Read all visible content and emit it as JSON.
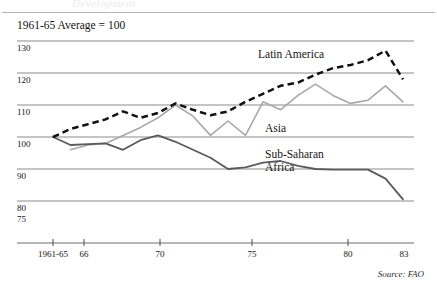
{
  "figure": {
    "ghost_title_fragment": "Development",
    "caption": "1961-65 Average = 100",
    "source": "Source: FAO"
  },
  "series_labels": {
    "latin_america": "Latin America",
    "asia": "Asia",
    "sub_saharan_africa_line1": "Sub-Saharan",
    "sub_saharan_africa_line2": "Africa"
  },
  "axis": {
    "y_ticks": [
      "130",
      "120",
      "110",
      "100",
      "90",
      "80"
    ],
    "y_extra_label": "75",
    "x_ticks": [
      "1961-65",
      "66",
      "70",
      "75",
      "80",
      "83"
    ]
  },
  "colors": {
    "latin_america": "#111111",
    "asia": "#a8a8a8",
    "sub_saharan_africa": "#5a5a5a",
    "gridline": "#8c8c8c",
    "axis": "#6e6e6e",
    "text": "#141414"
  },
  "chart_data": {
    "type": "line",
    "title": "",
    "subtitle": "1961-65 Average = 100",
    "xlabel": "",
    "ylabel": "Index (1961-65 Average = 100)",
    "xlim": [
      1963,
      1983
    ],
    "ylim": [
      75,
      132
    ],
    "yticks": [
      80,
      90,
      100,
      110,
      120,
      130
    ],
    "xticks": [
      1963,
      1966,
      1970,
      1975,
      1980,
      1983
    ],
    "xticklabels": [
      "1961-65",
      "66",
      "70",
      "75",
      "80",
      "83"
    ],
    "grid": "horizontal",
    "legend": "inline-annotations",
    "annotations": [
      {
        "text": "Latin America",
        "x": 1977.0,
        "y": 126.5
      },
      {
        "text": "Asia",
        "x": 1976.3,
        "y": 104.0
      },
      {
        "text": "Sub-Saharan Africa",
        "x": 1976.3,
        "y": 97.0
      }
    ],
    "series": [
      {
        "name": "Latin America",
        "style": "dashed",
        "color": "#111111",
        "x": [
          1963,
          1964,
          1965,
          1966,
          1967,
          1968,
          1969,
          1970,
          1971,
          1972,
          1973,
          1974,
          1975,
          1976,
          1977,
          1978,
          1979,
          1980,
          1981,
          1982,
          1983
        ],
        "y": [
          100.0,
          102.5,
          104.0,
          105.5,
          108.0,
          106.0,
          107.5,
          110.5,
          108.5,
          106.8,
          108.0,
          111.0,
          113.5,
          116.0,
          117.0,
          119.5,
          121.5,
          122.5,
          124.0,
          127.0,
          118.0
        ]
      },
      {
        "name": "Asia",
        "style": "solid",
        "color": "#a8a8a8",
        "x": [
          1964,
          1965,
          1966,
          1967,
          1968,
          1969,
          1970,
          1971,
          1972,
          1973,
          1974,
          1975,
          1976,
          1977,
          1978,
          1979,
          1980,
          1981,
          1982,
          1983
        ],
        "y": [
          96.0,
          97.5,
          98.0,
          100.5,
          103.0,
          106.0,
          110.0,
          106.5,
          100.5,
          105.0,
          100.5,
          111.0,
          108.5,
          113.0,
          116.5,
          113.0,
          110.5,
          111.5,
          116.0,
          111.0
        ]
      },
      {
        "name": "Sub-Saharan Africa",
        "style": "solid",
        "color": "#5a5a5a",
        "x": [
          1963,
          1964,
          1965,
          1966,
          1967,
          1968,
          1969,
          1970,
          1971,
          1972,
          1973,
          1974,
          1975,
          1976,
          1977,
          1978,
          1979,
          1980,
          1981,
          1982,
          1983
        ],
        "y": [
          100.0,
          97.5,
          97.8,
          98.0,
          96.0,
          99.0,
          100.5,
          98.5,
          96.0,
          93.5,
          90.0,
          90.5,
          92.0,
          92.5,
          91.0,
          90.0,
          89.8,
          89.8,
          89.8,
          87.0,
          80.5
        ]
      }
    ],
    "series_last_values": {
      "Latin America": 118.0,
      "Asia": 111.0,
      "Sub-Saharan Africa": 80.5
    }
  }
}
